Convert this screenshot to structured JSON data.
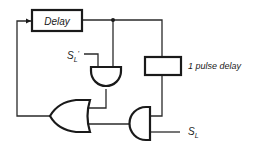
{
  "diagram": {
    "type": "logic-circuit",
    "components": {
      "delay_box": {
        "label": "Delay"
      },
      "pulse_delay_box": {
        "label": "1 pulse delay"
      },
      "and_gate_top": {
        "type": "AND"
      },
      "or_gate": {
        "type": "OR"
      },
      "and_gate_bottom": {
        "type": "AND"
      }
    },
    "signals": {
      "sl_prime": {
        "main": "S",
        "sub": "L",
        "suffix": "'"
      },
      "sl": {
        "main": "S",
        "sub": "L"
      }
    },
    "colors": {
      "line": "#1a1a1a",
      "background": "#ffffff"
    }
  }
}
